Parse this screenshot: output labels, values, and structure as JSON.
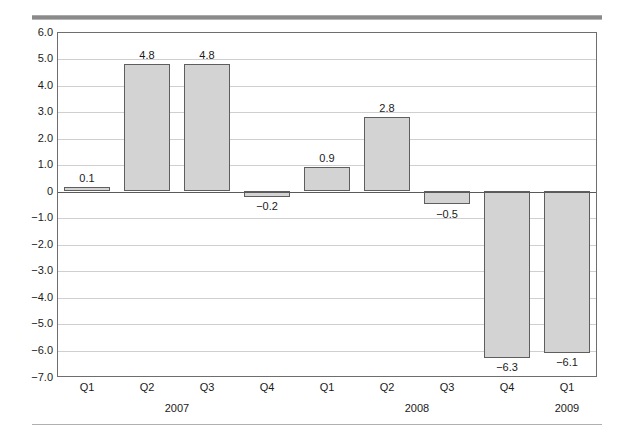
{
  "chart_data": {
    "type": "bar",
    "title": "",
    "subtitle": "",
    "xlabel": "",
    "ylabel": "",
    "categories": [
      "Q1",
      "Q2",
      "Q3",
      "Q4",
      "Q1",
      "Q2",
      "Q3",
      "Q4",
      "Q1"
    ],
    "groups": [
      {
        "label": "2007",
        "start_index": 0,
        "count": 4
      },
      {
        "label": "2008",
        "start_index": 4,
        "count": 4
      },
      {
        "label": "2009",
        "start_index": 8,
        "count": 1
      }
    ],
    "values": [
      0.1,
      4.8,
      4.8,
      -0.2,
      0.9,
      2.8,
      -0.5,
      -6.3,
      -6.1
    ],
    "value_labels": [
      "0.1",
      "4.8",
      "4.8",
      "−0.2",
      "0.9",
      "2.8",
      "−0.5",
      "−6.3",
      "−6.1"
    ],
    "ylim": [
      -7.0,
      6.0
    ],
    "ytick_values": [
      6.0,
      5.0,
      4.0,
      3.0,
      2.0,
      1.0,
      0.0,
      -1.0,
      -2.0,
      -3.0,
      -4.0,
      -5.0,
      -6.0,
      -7.0
    ],
    "ytick_labels": [
      "6.0",
      "5.0",
      "4.0",
      "3.0",
      "2.0",
      "1.0",
      "0",
      "−1.0",
      "−2.0",
      "−3.0",
      "−4.0",
      "−5.0",
      "−6.0",
      "−7.0"
    ],
    "grid": true,
    "legend": null,
    "legend_position": "none",
    "bar_fill_color": "#d3d3d3",
    "bar_border_color": "#5e5e5e",
    "gridline_color": "#cfcfcf",
    "zero_line_color": "#5a5a5a",
    "axis_color": "#6e6e6e",
    "text_color": "#1a1a1a"
  }
}
